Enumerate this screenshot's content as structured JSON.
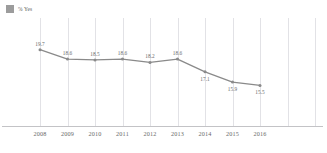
{
  "legend": {
    "swatch_color": "#9c9c9c",
    "label": "% Yes"
  },
  "chart_data": {
    "type": "line",
    "title": "",
    "subtitle": "",
    "xlabel": "",
    "ylabel": "",
    "grid": "vertical",
    "legend_position": "top-left",
    "series_color": "#8a8a8a",
    "marker": "circle",
    "data_labels": true,
    "categories": [
      "2008",
      "2009",
      "2010",
      "2011",
      "2012",
      "2013",
      "2014",
      "2015",
      "2016"
    ],
    "series": [
      {
        "name": "% Yes",
        "values": [
          19.7,
          18.6,
          18.5,
          18.6,
          18.2,
          18.6,
          17.1,
          15.9,
          15.5
        ]
      }
    ],
    "value_labels": [
      "19.7",
      "18.6",
      "18.5",
      "18.6",
      "18.2",
      "18.6",
      "17.1",
      "15.9",
      "15.5"
    ],
    "label_positions": [
      "above",
      "above",
      "above",
      "above",
      "above",
      "above",
      "below",
      "below",
      "below"
    ],
    "ylim": [
      14.5,
      20.6
    ]
  },
  "axis": {
    "tick_labels": [
      "2008",
      "2009",
      "2010",
      "2011",
      "2012",
      "2013",
      "2014",
      "2015",
      "2016"
    ]
  }
}
